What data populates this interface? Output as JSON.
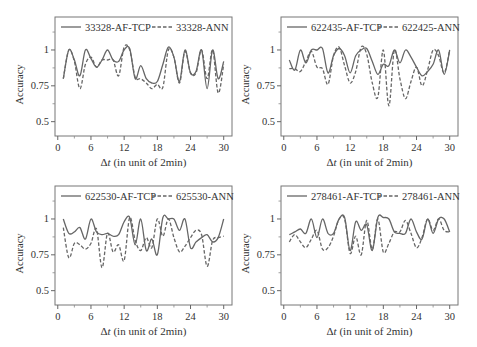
{
  "figure": {
    "ylabel": "Accuracy",
    "xlabel_delta": "Δ",
    "xlabel_var": "t",
    "xlabel_rest": " (in unit of 2min)",
    "yticks": [
      0.5,
      0.75,
      1
    ],
    "ytick_labels": [
      "0.5",
      "0.75",
      "1"
    ],
    "xticks": [
      0,
      6,
      12,
      18,
      24,
      30
    ],
    "xtick_labels": [
      "0",
      "6",
      "12",
      "18",
      "24",
      "30"
    ],
    "minor_xticks": [
      3,
      9,
      15,
      21,
      27
    ],
    "minor_yticks": [
      0.625,
      0.875,
      1.125
    ],
    "xlim": [
      -0.5,
      31.5
    ],
    "ylim": [
      0.4,
      1.23
    ],
    "line_color": "#666666"
  },
  "chart_data": [
    {
      "type": "line",
      "title": "",
      "xlabel": "Δt (in unit of 2min)",
      "ylabel": "Accuracy",
      "xlim": [
        0,
        30
      ],
      "ylim": [
        0.4,
        1.2
      ],
      "grid": false,
      "legend_position": "top",
      "x": [
        1,
        2,
        3,
        4,
        5,
        6,
        7,
        8,
        9,
        10,
        11,
        12,
        13,
        14,
        15,
        16,
        17,
        18,
        19,
        20,
        21,
        22,
        23,
        24,
        25,
        26,
        27,
        28,
        29,
        30
      ],
      "series": [
        {
          "name": "33328-AF-TCP",
          "style": "solid",
          "values": [
            0.8,
            1.0,
            0.93,
            0.82,
            1.0,
            0.94,
            0.88,
            0.93,
            1.0,
            0.93,
            0.92,
            1.0,
            1.01,
            0.8,
            0.89,
            0.8,
            0.77,
            0.78,
            0.9,
            1.02,
            0.95,
            0.78,
            1.0,
            0.84,
            0.85,
            1.0,
            0.73,
            1.0,
            0.8,
            0.92
          ]
        },
        {
          "name": "33328-ANN",
          "style": "dashed",
          "values": [
            0.8,
            1.0,
            0.92,
            0.73,
            0.9,
            0.95,
            0.88,
            0.93,
            0.93,
            0.93,
            0.82,
            1.02,
            1.0,
            0.81,
            0.8,
            0.77,
            0.73,
            0.76,
            0.74,
            1.0,
            0.95,
            0.77,
            0.99,
            0.84,
            0.84,
            1.0,
            0.8,
            1.0,
            0.7,
            0.9
          ]
        }
      ]
    },
    {
      "type": "line",
      "title": "",
      "xlabel": "Δt (in unit of 2min)",
      "ylabel": "Accuracy",
      "xlim": [
        0,
        30
      ],
      "ylim": [
        0.4,
        1.2
      ],
      "grid": false,
      "legend_position": "top",
      "x": [
        1,
        2,
        3,
        4,
        5,
        6,
        7,
        8,
        9,
        10,
        11,
        12,
        13,
        14,
        15,
        16,
        17,
        18,
        19,
        20,
        21,
        22,
        23,
        24,
        25,
        26,
        27,
        28,
        29,
        30
      ],
      "series": [
        {
          "name": "622435-AF-TCP",
          "style": "solid",
          "values": [
            0.93,
            0.86,
            1.0,
            0.91,
            1.0,
            1.0,
            1.01,
            0.84,
            0.96,
            1.01,
            0.96,
            0.84,
            0.96,
            1.0,
            1.01,
            0.92,
            0.83,
            0.9,
            0.89,
            1.0,
            0.91,
            1.0,
            0.95,
            0.88,
            0.82,
            0.85,
            0.9,
            1.0,
            0.83,
            1.0
          ]
        },
        {
          "name": "622425-ANN",
          "style": "dashed",
          "values": [
            0.87,
            0.87,
            0.85,
            0.92,
            0.99,
            0.88,
            0.87,
            0.76,
            0.96,
            1.02,
            0.89,
            0.77,
            0.85,
            1.02,
            0.97,
            0.77,
            0.67,
            1.0,
            0.61,
            1.0,
            0.8,
            0.66,
            0.78,
            0.88,
            0.75,
            0.86,
            1.0,
            0.96,
            0.84,
            1.0
          ]
        }
      ]
    },
    {
      "type": "line",
      "title": "",
      "xlabel": "Δt (in unit of 2min)",
      "ylabel": "Accuracy",
      "xlim": [
        0,
        30
      ],
      "ylim": [
        0.4,
        1.2
      ],
      "grid": false,
      "legend_position": "top",
      "x": [
        1,
        2,
        3,
        4,
        5,
        6,
        7,
        8,
        9,
        10,
        11,
        12,
        13,
        14,
        15,
        16,
        17,
        18,
        19,
        20,
        21,
        22,
        23,
        24,
        25,
        26,
        27,
        28,
        29,
        30
      ],
      "series": [
        {
          "name": "622530-AF-TCP",
          "style": "solid",
          "values": [
            1.0,
            0.9,
            0.91,
            0.94,
            0.86,
            1.0,
            0.91,
            0.89,
            0.9,
            0.88,
            0.89,
            0.98,
            1.01,
            0.82,
            1.0,
            0.78,
            0.86,
            0.75,
            1.01,
            1.0,
            1.0,
            0.92,
            1.0,
            0.8,
            0.84,
            0.87,
            0.89,
            0.84,
            0.87,
            1.0
          ]
        },
        {
          "name": "625530-ANN",
          "style": "dashed",
          "values": [
            0.94,
            0.73,
            0.83,
            0.82,
            0.79,
            0.83,
            0.93,
            0.66,
            0.9,
            0.77,
            0.82,
            0.71,
            1.01,
            0.85,
            0.78,
            0.87,
            0.8,
            1.0,
            0.88,
            1.0,
            0.87,
            0.77,
            0.81,
            0.87,
            0.92,
            0.89,
            0.67,
            0.85,
            0.87,
            0.88
          ]
        }
      ]
    },
    {
      "type": "line",
      "title": "",
      "xlabel": "Δt (in unit of 2min)",
      "ylabel": "Accuracy",
      "xlim": [
        0,
        30
      ],
      "ylim": [
        0.4,
        1.2
      ],
      "grid": false,
      "legend_position": "top",
      "x": [
        1,
        2,
        3,
        4,
        5,
        6,
        7,
        8,
        9,
        10,
        11,
        12,
        13,
        14,
        15,
        16,
        17,
        18,
        19,
        20,
        21,
        22,
        23,
        24,
        25,
        26,
        27,
        28,
        29,
        30
      ],
      "series": [
        {
          "name": "278461-AF-TCP",
          "style": "solid",
          "values": [
            0.89,
            0.91,
            0.93,
            0.9,
            1.0,
            0.87,
            1.0,
            0.9,
            0.9,
            1.0,
            1.01,
            0.78,
            0.98,
            0.92,
            0.96,
            0.78,
            1.01,
            1.01,
            1.0,
            0.91,
            0.9,
            0.9,
            1.0,
            0.91,
            0.86,
            1.0,
            0.9,
            1.0,
            1.0,
            0.91
          ]
        },
        {
          "name": "278461-ANN",
          "style": "dashed",
          "values": [
            0.84,
            0.89,
            0.84,
            0.8,
            0.86,
            0.92,
            0.79,
            0.8,
            0.88,
            1.0,
            1.0,
            0.76,
            0.88,
            0.75,
            0.99,
            0.79,
            1.0,
            0.77,
            0.83,
            0.91,
            0.91,
            0.99,
            0.9,
            0.8,
            0.87,
            1.0,
            0.92,
            1.0,
            0.92,
            0.91
          ]
        }
      ]
    }
  ]
}
